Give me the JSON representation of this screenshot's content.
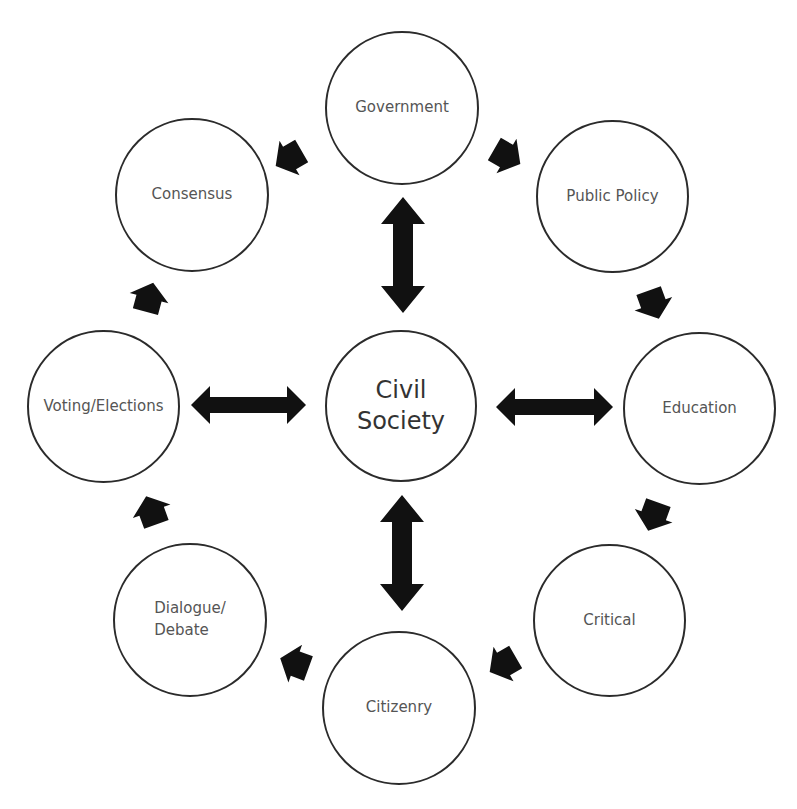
{
  "diagram": {
    "center": {
      "label_line1": "Civil",
      "label_line2": "Society"
    },
    "nodes": [
      {
        "id": "government",
        "label": "Government"
      },
      {
        "id": "public-policy",
        "label": "Public Policy"
      },
      {
        "id": "education",
        "label": "Education"
      },
      {
        "id": "critical",
        "label": "Critical"
      },
      {
        "id": "citizenry",
        "label": "Citizenry"
      },
      {
        "id": "dialogue-debate",
        "label_line1": "Dialogue/",
        "label_line2": "Debate"
      },
      {
        "id": "voting-elections",
        "label": "Voting/Elections"
      },
      {
        "id": "consensus",
        "label": "Consensus"
      }
    ],
    "cycle_order": [
      "Government",
      "Public Policy",
      "Education",
      "Critical",
      "Citizenry",
      "Dialogue/Debate",
      "Voting/Elections",
      "Consensus",
      "Government"
    ],
    "bidirectional_links": [
      [
        "Civil Society",
        "Government"
      ],
      [
        "Civil Society",
        "Education"
      ],
      [
        "Civil Society",
        "Citizenry"
      ],
      [
        "Civil Society",
        "Voting/Elections"
      ]
    ],
    "colors": {
      "circle_stroke": "#2b2b2b",
      "arrow_fill": "#111111",
      "label_text": "#555555",
      "center_text": "#333333",
      "background": "#ffffff"
    }
  }
}
